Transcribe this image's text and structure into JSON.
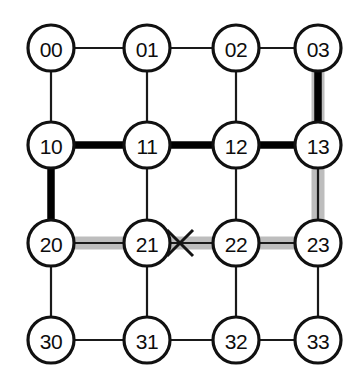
{
  "diagram": {
    "type": "node-link-grid",
    "grid": {
      "rows": 4,
      "cols": 4
    },
    "colors": {
      "node_fill": "#ffffff",
      "node_stroke": "#111111",
      "edge_normal": "#1a1a1a",
      "edge_thick": "#000000",
      "edge_highlight": "#bdbdbd",
      "fault_mark": "#141414",
      "background": "#ffffff"
    },
    "geometry": {
      "cols_x": [
        51,
        147,
        236,
        318
      ],
      "rows_y": [
        48,
        145,
        243,
        340
      ],
      "node_radius": 23,
      "node_stroke_width": 3.2,
      "edge_normal_width": 2.2,
      "edge_thick_width": 7.5,
      "edge_highlight_width": 13
    },
    "nodes": [
      {
        "id": "00",
        "label": "00",
        "row": 0,
        "col": 0,
        "cx": 51,
        "cy": 48
      },
      {
        "id": "01",
        "label": "01",
        "row": 0,
        "col": 1,
        "cx": 147,
        "cy": 48
      },
      {
        "id": "02",
        "label": "02",
        "row": 0,
        "col": 2,
        "cx": 236,
        "cy": 48
      },
      {
        "id": "03",
        "label": "03",
        "row": 0,
        "col": 3,
        "cx": 318,
        "cy": 48
      },
      {
        "id": "10",
        "label": "10",
        "row": 1,
        "col": 0,
        "cx": 51,
        "cy": 145
      },
      {
        "id": "11",
        "label": "11",
        "row": 1,
        "col": 1,
        "cx": 147,
        "cy": 145
      },
      {
        "id": "12",
        "label": "12",
        "row": 1,
        "col": 2,
        "cx": 236,
        "cy": 145
      },
      {
        "id": "13",
        "label": "13",
        "row": 1,
        "col": 3,
        "cx": 318,
        "cy": 145
      },
      {
        "id": "20",
        "label": "20",
        "row": 2,
        "col": 0,
        "cx": 51,
        "cy": 243
      },
      {
        "id": "21",
        "label": "21",
        "row": 2,
        "col": 1,
        "cx": 147,
        "cy": 243
      },
      {
        "id": "22",
        "label": "22",
        "row": 2,
        "col": 2,
        "cx": 236,
        "cy": 243
      },
      {
        "id": "23",
        "label": "23",
        "row": 2,
        "col": 3,
        "cx": 318,
        "cy": 243
      },
      {
        "id": "30",
        "label": "30",
        "row": 3,
        "col": 0,
        "cx": 51,
        "cy": 340
      },
      {
        "id": "31",
        "label": "31",
        "row": 3,
        "col": 1,
        "cx": 147,
        "cy": 340
      },
      {
        "id": "32",
        "label": "32",
        "row": 3,
        "col": 2,
        "cx": 236,
        "cy": 340
      },
      {
        "id": "33",
        "label": "33",
        "row": 3,
        "col": 3,
        "cx": 318,
        "cy": 340
      }
    ],
    "edges": [
      {
        "from": "00",
        "to": "01",
        "orientation": "horizontal",
        "style": "normal",
        "highlight": false
      },
      {
        "from": "01",
        "to": "02",
        "orientation": "horizontal",
        "style": "normal",
        "highlight": false
      },
      {
        "from": "02",
        "to": "03",
        "orientation": "horizontal",
        "style": "normal",
        "highlight": false
      },
      {
        "from": "10",
        "to": "11",
        "orientation": "horizontal",
        "style": "thick",
        "highlight": false
      },
      {
        "from": "11",
        "to": "12",
        "orientation": "horizontal",
        "style": "thick",
        "highlight": false
      },
      {
        "from": "12",
        "to": "13",
        "orientation": "horizontal",
        "style": "thick",
        "highlight": false
      },
      {
        "from": "20",
        "to": "21",
        "orientation": "horizontal",
        "style": "normal",
        "highlight": true
      },
      {
        "from": "21",
        "to": "22",
        "orientation": "horizontal",
        "style": "normal",
        "highlight": true,
        "fault": true
      },
      {
        "from": "22",
        "to": "23",
        "orientation": "horizontal",
        "style": "normal",
        "highlight": true
      },
      {
        "from": "30",
        "to": "31",
        "orientation": "horizontal",
        "style": "normal",
        "highlight": false
      },
      {
        "from": "31",
        "to": "32",
        "orientation": "horizontal",
        "style": "normal",
        "highlight": false
      },
      {
        "from": "32",
        "to": "33",
        "orientation": "horizontal",
        "style": "normal",
        "highlight": false
      },
      {
        "from": "00",
        "to": "10",
        "orientation": "vertical",
        "style": "normal",
        "highlight": false
      },
      {
        "from": "01",
        "to": "11",
        "orientation": "vertical",
        "style": "normal",
        "highlight": false
      },
      {
        "from": "02",
        "to": "12",
        "orientation": "vertical",
        "style": "normal",
        "highlight": false
      },
      {
        "from": "03",
        "to": "13",
        "orientation": "vertical",
        "style": "thick",
        "highlight": true
      },
      {
        "from": "10",
        "to": "20",
        "orientation": "vertical",
        "style": "thick",
        "highlight": false
      },
      {
        "from": "11",
        "to": "21",
        "orientation": "vertical",
        "style": "normal",
        "highlight": false
      },
      {
        "from": "12",
        "to": "22",
        "orientation": "vertical",
        "style": "normal",
        "highlight": false
      },
      {
        "from": "13",
        "to": "23",
        "orientation": "vertical",
        "style": "normal",
        "highlight": true
      },
      {
        "from": "20",
        "to": "30",
        "orientation": "vertical",
        "style": "normal",
        "highlight": false
      },
      {
        "from": "21",
        "to": "31",
        "orientation": "vertical",
        "style": "normal",
        "highlight": false
      },
      {
        "from": "22",
        "to": "32",
        "orientation": "vertical",
        "style": "normal",
        "highlight": false
      },
      {
        "from": "23",
        "to": "33",
        "orientation": "vertical",
        "style": "normal",
        "highlight": false
      }
    ],
    "fault_marks": [
      {
        "id": "link-fault-21-22",
        "symbol": "X",
        "cx": 180,
        "cy": 243,
        "size": 13,
        "stroke_width": 3.0
      }
    ]
  }
}
